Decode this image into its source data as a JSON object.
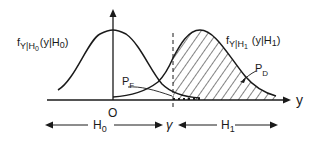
{
  "diagram": {
    "colors": {
      "ink": "#1a1a1a",
      "background": "#ffffff"
    },
    "axes": {
      "x_label": "y",
      "origin_label": "O"
    },
    "threshold": {
      "label": "γ"
    },
    "curves": [
      {
        "id": "h0",
        "label_f": "f",
        "label_sub": "Y|H",
        "label_sub2": "0",
        "label_arg": "(y|H",
        "label_arg_sub": "0",
        "label_close": ")"
      },
      {
        "id": "h1",
        "label_f": "f",
        "label_sub": "Y|H",
        "label_sub2": "1",
        "label_arg": "(y|H",
        "label_arg_sub": "1",
        "label_close": ")"
      }
    ],
    "areas": {
      "false_alarm": {
        "label": "P",
        "sub": "F"
      },
      "detection": {
        "label": "P",
        "sub": "D"
      }
    },
    "regions": {
      "h0": {
        "label": "H",
        "sub": "0"
      },
      "h1": {
        "label": "H",
        "sub": "1"
      }
    }
  }
}
